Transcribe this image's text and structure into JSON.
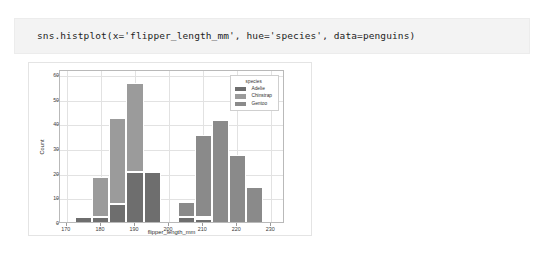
{
  "code_cell": {
    "code": "sns.histplot(x='flipper_length_mm', hue='species', data=penguins)"
  },
  "chart_data": {
    "type": "bar",
    "subtype": "stacked-histogram",
    "title": "",
    "xlabel": "flipper_length_mm",
    "ylabel": "Count",
    "xlim": [
      168,
      234
    ],
    "ylim": [
      0,
      62
    ],
    "grid": true,
    "legend": {
      "title": "species",
      "position": "upper right",
      "entries": [
        {
          "name": "Adelie",
          "color": "#6e6e6e"
        },
        {
          "name": "Chinstrap",
          "color": "#9b9b9b"
        },
        {
          "name": "Gentoo",
          "color": "#8a8a8a"
        }
      ]
    },
    "xticks": [
      170,
      180,
      190,
      200,
      210,
      220,
      230
    ],
    "yticks": [
      0,
      10,
      20,
      30,
      40,
      50,
      60
    ],
    "bin_width": 5,
    "bin_centers": [
      175,
      180,
      185,
      190,
      195,
      200,
      205,
      210,
      215,
      220,
      225,
      230
    ],
    "bin_edges": [
      172.5,
      177.5,
      182.5,
      187.5,
      192.5,
      197.5,
      202.5,
      207.5,
      212.5,
      217.5,
      222.5,
      227.5,
      232.5
    ],
    "categories": [
      "172.5-177.5",
      "177.5-182.5",
      "182.5-187.5",
      "187.5-192.5",
      "192.5-197.5",
      "197.5-202.5",
      "202.5-207.5",
      "207.5-212.5",
      "212.5-217.5",
      "217.5-222.5",
      "222.5-227.5",
      "227.5-232.5"
    ],
    "series": [
      {
        "name": "Adelie",
        "color": "#6e6e6e",
        "values": [
          3,
          3,
          8,
          21,
          21,
          0,
          3,
          2,
          0,
          0,
          0,
          0
        ]
      },
      {
        "name": "Chinstrap",
        "color": "#9b9b9b",
        "values": [
          0,
          16,
          35,
          36,
          1,
          0,
          0,
          1,
          0,
          0,
          0,
          0
        ]
      },
      {
        "name": "Gentoo",
        "color": "#8a8a8a",
        "values": [
          0,
          0,
          0,
          0,
          0,
          0,
          6,
          33,
          42,
          28,
          15,
          0
        ]
      }
    ],
    "totals": [
      3,
      19,
      43,
      57,
      22,
      0,
      9,
      36,
      42,
      28,
      15,
      0
    ]
  }
}
